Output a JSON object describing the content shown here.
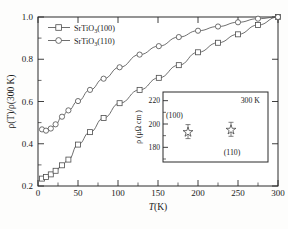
{
  "figure": {
    "title": "",
    "background_color": "#ffffff",
    "line_color": "#555555",
    "marker_face_color": "#ffffff",
    "axis_color": "#2a2a2a"
  },
  "main_axes": {
    "xlabel": "T(K)",
    "xlabel_italic_part": "T",
    "xlabel_rest": "(K)",
    "ylabel": "ρ(T)/ρ(300 K)",
    "xticks": [
      "0",
      "50",
      "100",
      "150",
      "200",
      "250",
      "300"
    ],
    "yticks": [
      "0.2",
      "0.4",
      "0.6",
      "0.8",
      "1.0"
    ],
    "xlim": [
      0,
      300
    ],
    "ylim": [
      0.2,
      1.0
    ]
  },
  "legend": {
    "position": "upper-left",
    "entries": [
      {
        "label": "SrTiO3(100)",
        "label_pre": "SrTiO",
        "label_sub": "3",
        "label_post": "(100)",
        "marker": "square",
        "marker_name": "legend-marker-square"
      },
      {
        "label": "SrTiO3(110)",
        "label_pre": "SrTiO",
        "label_sub": "3",
        "label_post": "(110)",
        "marker": "circle",
        "marker_name": "legend-marker-circle"
      }
    ]
  },
  "inset": {
    "ylabel": "ρ (μΩ cm )",
    "yticks": [
      "180",
      "200",
      "220"
    ],
    "ylim": [
      170,
      230
    ],
    "xlim": [
      0,
      2
    ],
    "temperature_annotation": "300 K",
    "point_labels": [
      "(100)",
      "(110)"
    ],
    "points": [
      {
        "label": "(100)",
        "x": 0.62,
        "value": 195,
        "error": 6,
        "marker": "star"
      },
      {
        "label": "(110)",
        "x": 1.45,
        "value": 197,
        "error": 6,
        "marker": "star"
      }
    ]
  },
  "chart_data": {
    "type": "line",
    "title": "",
    "xlabel": "T(K)",
    "ylabel": "ρ(T)/ρ(300 K)",
    "xlim": [
      0,
      300
    ],
    "ylim": [
      0.2,
      1.0
    ],
    "grid": false,
    "legend_position": "upper left",
    "series": [
      {
        "name": "SrTiO3(100)",
        "marker": "square",
        "x": [
          5,
          10,
          16,
          22,
          30,
          38,
          50,
          65,
          82,
          102,
          127,
          151,
          176,
          200,
          225,
          250,
          275,
          300
        ],
        "y": [
          0.235,
          0.243,
          0.255,
          0.272,
          0.298,
          0.325,
          0.396,
          0.455,
          0.522,
          0.592,
          0.655,
          0.712,
          0.772,
          0.833,
          0.878,
          0.918,
          0.962,
          1.0
        ]
      },
      {
        "name": "SrTiO3(110)",
        "marker": "circle",
        "x": [
          5,
          10,
          16,
          22,
          30,
          38,
          50,
          65,
          82,
          102,
          127,
          151,
          176,
          200,
          225,
          250,
          275,
          300
        ],
        "y": [
          0.468,
          0.462,
          0.472,
          0.492,
          0.528,
          0.558,
          0.602,
          0.655,
          0.708,
          0.762,
          0.822,
          0.862,
          0.905,
          0.935,
          0.955,
          0.975,
          0.992,
          1.0
        ]
      }
    ],
    "inset": {
      "type": "scatter",
      "ylabel": "ρ (μΩ cm )",
      "ylim": [
        170,
        230
      ],
      "yticks": [
        180,
        200,
        220
      ],
      "annotation": "300 K",
      "points": [
        {
          "label": "(100)",
          "value": 195,
          "error": 6
        },
        {
          "label": "(110)",
          "value": 197,
          "error": 6
        }
      ]
    }
  }
}
